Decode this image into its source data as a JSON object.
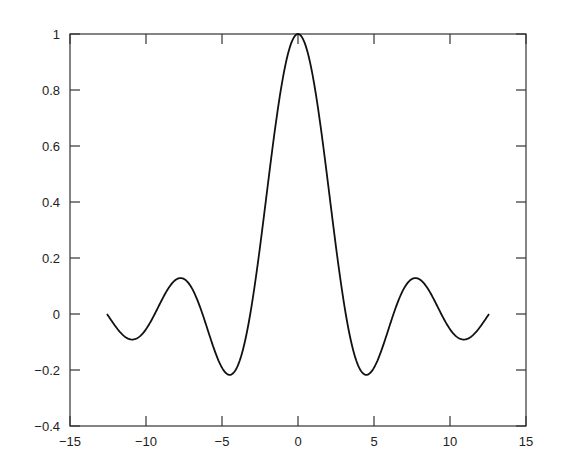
{
  "chart_data": {
    "type": "line",
    "title": "",
    "xlabel": "",
    "ylabel": "",
    "xlim": [
      -15,
      15
    ],
    "ylim": [
      -0.4,
      1
    ],
    "grid": false,
    "legend": null,
    "x_ticks": [
      -15,
      -10,
      -5,
      0,
      5,
      10,
      15
    ],
    "x_tick_labels": [
      "−15",
      "−10",
      "−5",
      "0",
      "5",
      "10",
      "15"
    ],
    "y_ticks": [
      1,
      0.8,
      0.6,
      0.4,
      0.2,
      0,
      -0.2,
      -0.4
    ],
    "y_tick_labels": [
      "1",
      "0.8",
      "0.6",
      "0.4",
      "0.2",
      "0",
      "−0.2",
      "−0.4"
    ],
    "series": [
      {
        "name": "sin(x)/x",
        "color": "#111111",
        "x_range": [
          -12.566,
          12.566
        ],
        "x": [
          -12.5,
          -12,
          -11.5,
          -11,
          -10.5,
          -10,
          -9.5,
          -9,
          -8.5,
          -8,
          -7.5,
          -7,
          -6.5,
          -6,
          -5.5,
          -5,
          -4.5,
          -4,
          -3.5,
          -3,
          -2.5,
          -2,
          -1.5,
          -1,
          -0.5,
          0,
          0.5,
          1,
          1.5,
          2,
          2.5,
          3,
          3.5,
          4,
          4.5,
          5,
          5.5,
          6,
          6.5,
          7,
          7.5,
          8,
          8.5,
          9,
          9.5,
          10,
          10.5,
          11,
          11.5,
          12,
          12.5
        ],
        "y": [
          -0.005,
          -0.045,
          -0.078,
          -0.091,
          -0.084,
          -0.054,
          -0.008,
          0.046,
          0.094,
          0.124,
          0.125,
          0.094,
          0.033,
          -0.047,
          -0.128,
          -0.192,
          -0.217,
          -0.189,
          -0.1,
          0.047,
          0.239,
          0.455,
          0.665,
          0.841,
          0.959,
          1.0,
          0.959,
          0.841,
          0.665,
          0.455,
          0.239,
          0.047,
          -0.1,
          -0.189,
          -0.217,
          -0.192,
          -0.128,
          -0.047,
          0.033,
          0.094,
          0.125,
          0.124,
          0.094,
          0.046,
          -0.008,
          -0.054,
          -0.084,
          -0.091,
          -0.078,
          -0.045,
          -0.005
        ]
      }
    ]
  }
}
